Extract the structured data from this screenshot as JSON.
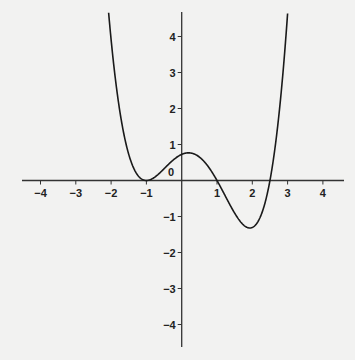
{
  "chart_data": {
    "type": "line",
    "title": "",
    "xlabel": "",
    "ylabel": "",
    "xlim": [
      -4.5,
      4.5
    ],
    "ylim": [
      -4.7,
      4.7
    ],
    "grid": false,
    "legend": null,
    "x_ticks": [
      -4,
      -3,
      -2,
      -1,
      1,
      2,
      3,
      4
    ],
    "x_tick_labels": [
      "−4",
      "−3",
      "−2",
      "−1",
      "1",
      "2",
      "3",
      "4"
    ],
    "y_ticks": [
      4,
      3,
      2,
      1,
      -1,
      -2,
      -3,
      -4
    ],
    "y_tick_labels": [
      "4",
      "3",
      "2",
      "1",
      "−1",
      "−2",
      "−3",
      "−4"
    ],
    "origin_label": "0",
    "series": [
      {
        "name": "f(x)",
        "description": "quartic with double root at x=-1, roots at x=1 and x=2.5",
        "formula_coefficient": 0.29,
        "roots": [
          -1,
          -1,
          1,
          2.5
        ],
        "x": [
          -2.1,
          -2.0,
          -1.8,
          -1.6,
          -1.4,
          -1.2,
          -1.0,
          -0.8,
          -0.6,
          -0.4,
          -0.2,
          0,
          0.2,
          0.4,
          0.6,
          0.8,
          1.0,
          1.2,
          1.4,
          1.6,
          1.8,
          2.0,
          2.2,
          2.4,
          2.5,
          2.6,
          2.8,
          3.0,
          3.03
        ],
        "y": [
          5.0,
          3.92,
          2.24,
          1.11,
          0.43,
          0.09,
          0,
          0.07,
          0.23,
          0.42,
          0.6,
          0.73,
          0.77,
          0.72,
          0.56,
          0.32,
          0,
          -0.36,
          -0.73,
          -1.06,
          -1.27,
          -1.31,
          -1.07,
          -0.47,
          0,
          0.6,
          2.26,
          4.64,
          5.0
        ],
        "color": "#1a1a1a"
      }
    ]
  }
}
